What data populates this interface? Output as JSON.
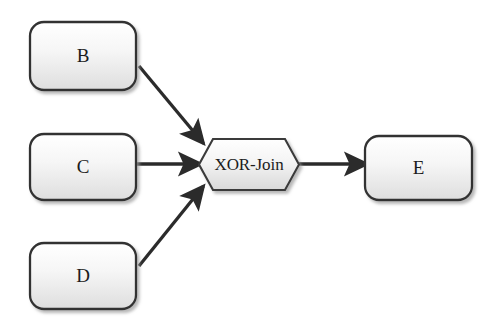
{
  "diagram": {
    "type": "process-flow",
    "background_color": "#ffffff",
    "node_fill_light": "#fefefe",
    "node_fill_dark": "#e2e2e2",
    "node_border_color": "#333333",
    "edge_color": "#2b2b2b",
    "text_color": "#1c1c1c",
    "nodes": [
      {
        "id": "B",
        "label": "B",
        "shape": "rounded-rectangle",
        "x": 30,
        "y": 22,
        "width": 106,
        "height": 68
      },
      {
        "id": "C",
        "label": "C",
        "shape": "rounded-rectangle",
        "x": 30,
        "y": 134,
        "width": 106,
        "height": 66
      },
      {
        "id": "D",
        "label": "D",
        "shape": "rounded-rectangle",
        "x": 30,
        "y": 243,
        "width": 106,
        "height": 66
      },
      {
        "id": "XOR-Join",
        "label": "XOR-Join",
        "shape": "hexagon",
        "x": 199,
        "y": 139,
        "width": 100,
        "height": 51
      },
      {
        "id": "E",
        "label": "E",
        "shape": "rounded-rectangle",
        "x": 365,
        "y": 136,
        "width": 107,
        "height": 64
      }
    ],
    "edges": [
      {
        "id": "B-to-join",
        "from": "B",
        "to": "XOR-Join",
        "direction": "diagonal-down-right",
        "arrowhead": "filled-triangle"
      },
      {
        "id": "C-to-join",
        "from": "C",
        "to": "XOR-Join",
        "direction": "horizontal-right",
        "arrowhead": "filled-triangle"
      },
      {
        "id": "D-to-join",
        "from": "D",
        "to": "XOR-Join",
        "direction": "diagonal-up-right",
        "arrowhead": "filled-triangle"
      },
      {
        "id": "join-to-E",
        "from": "XOR-Join",
        "to": "E",
        "direction": "horizontal-right",
        "arrowhead": "filled-triangle"
      }
    ]
  }
}
